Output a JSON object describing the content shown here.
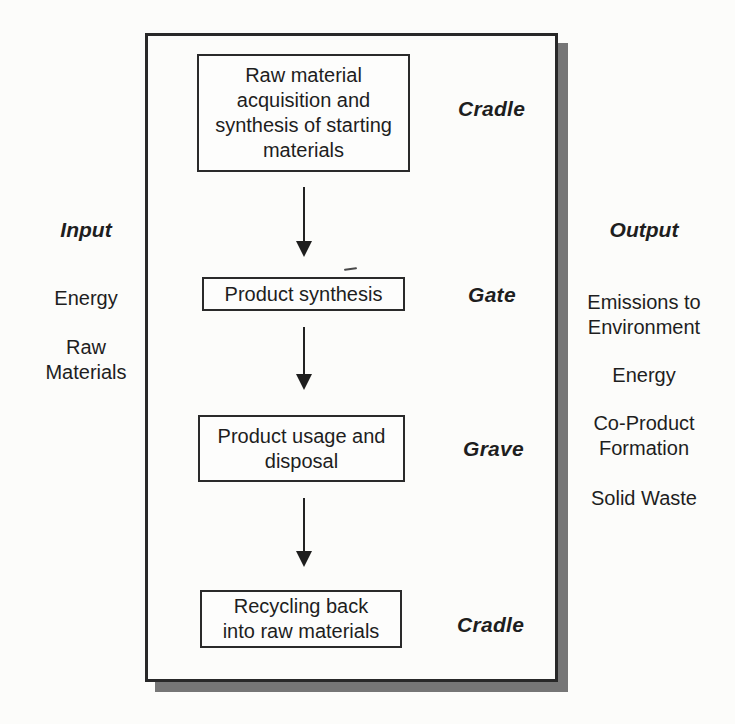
{
  "palette": {
    "background": "#fcfcfa",
    "ink": "#1e1e1e",
    "box_border": "#2a2a2a",
    "frame_shadow": "#767676"
  },
  "diagram": {
    "stages": [
      {
        "box": "Raw material\nacquisition and\nsynthesis of starting\nmaterials",
        "label": "Cradle"
      },
      {
        "box": "Product synthesis",
        "label": "Gate"
      },
      {
        "box": "Product usage and\ndisposal",
        "label": "Grave"
      },
      {
        "box": "Recycling back\ninto raw materials",
        "label": "Cradle"
      }
    ]
  },
  "inputs": {
    "title": "Input",
    "items": [
      "Energy",
      "Raw\nMaterials"
    ]
  },
  "outputs": {
    "title": "Output",
    "items": [
      "Emissions to\nEnvironment",
      "Energy",
      "Co-Product\nFormation",
      "Solid Waste"
    ]
  }
}
